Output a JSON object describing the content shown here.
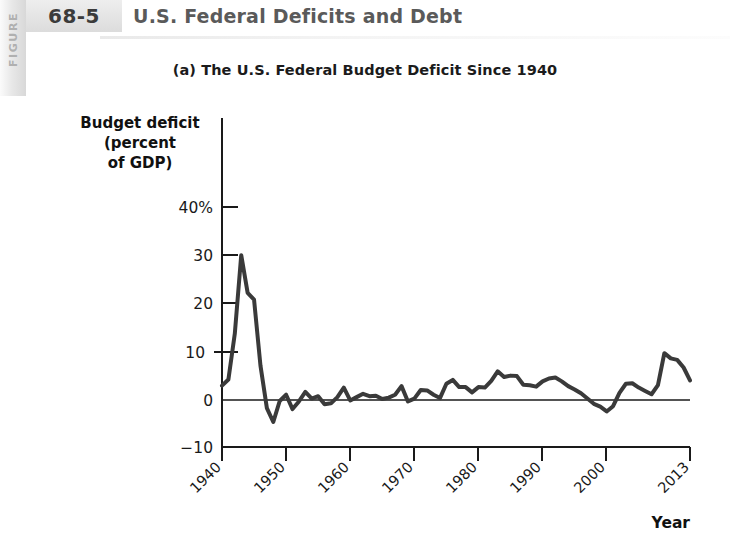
{
  "figure": {
    "side_label": "FIGURE",
    "number": "68-5",
    "title": "U.S. Federal Deficits and Debt"
  },
  "chart_data": {
    "type": "line",
    "title": "(a) The U.S. Federal Budget Deficit Since 1940",
    "xlabel": "Year",
    "ylabel": "Budget deficit (percent of GDP)",
    "ylabel_lines": [
      "Budget deficit",
      "(percent",
      "of GDP)"
    ],
    "ytick_labels": [
      "40%",
      "30",
      "20",
      "10",
      "0",
      "−10"
    ],
    "ytick_values": [
      40,
      30,
      20,
      10,
      0,
      -10
    ],
    "xtick_labels": [
      "1940",
      "1950",
      "1960",
      "1970",
      "1980",
      "1990",
      "2000",
      "2013"
    ],
    "xtick_values": [
      1940,
      1950,
      1960,
      1970,
      1980,
      1990,
      2000,
      2013
    ],
    "xlim": [
      1940,
      2013
    ],
    "ylim": [
      -10,
      43
    ],
    "grid": false,
    "legend": false,
    "zero_line": true,
    "line_color": "#3a3a3a",
    "line_width": 4,
    "x": [
      1940,
      1941,
      1942,
      1943,
      1944,
      1945,
      1946,
      1947,
      1948,
      1949,
      1950,
      1951,
      1952,
      1953,
      1954,
      1955,
      1956,
      1957,
      1958,
      1959,
      1960,
      1961,
      1962,
      1963,
      1964,
      1965,
      1966,
      1967,
      1968,
      1969,
      1970,
      1971,
      1972,
      1973,
      1974,
      1975,
      1976,
      1977,
      1978,
      1979,
      1980,
      1981,
      1982,
      1983,
      1984,
      1985,
      1986,
      1987,
      1988,
      1989,
      1990,
      1991,
      1992,
      1993,
      1994,
      1995,
      1996,
      1997,
      1998,
      1999,
      2000,
      2001,
      2002,
      2003,
      2004,
      2005,
      2006,
      2007,
      2008,
      2009,
      2010,
      2011,
      2012,
      2013
    ],
    "y": [
      3.0,
      4.3,
      13.9,
      30.3,
      22.4,
      21.0,
      7.2,
      -1.7,
      -4.6,
      -0.2,
      1.1,
      -1.9,
      -0.3,
      1.7,
      0.3,
      0.8,
      -0.9,
      -0.7,
      0.6,
      2.6,
      -0.1,
      0.6,
      1.3,
      0.8,
      0.9,
      0.2,
      0.5,
      1.1,
      2.9,
      -0.3,
      0.3,
      2.1,
      2.0,
      1.1,
      0.4,
      3.4,
      4.2,
      2.7,
      2.7,
      1.6,
      2.7,
      2.6,
      4.0,
      6.0,
      4.8,
      5.1,
      5.0,
      3.2,
      3.1,
      2.8,
      3.9,
      4.5,
      4.7,
      3.9,
      2.9,
      2.2,
      1.4,
      0.3,
      -0.8,
      -1.4,
      -2.4,
      -1.3,
      1.5,
      3.4,
      3.5,
      2.6,
      1.9,
      1.2,
      3.1,
      9.8,
      8.7,
      8.4,
      6.8,
      4.1
    ]
  }
}
